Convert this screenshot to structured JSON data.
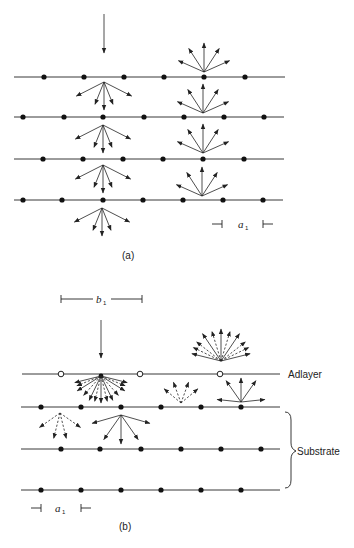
{
  "figure": {
    "panel_a": {
      "caption": "(a)",
      "spacing_label": "a",
      "spacing_subscript": "1",
      "incident_beam": {
        "x": 104,
        "y1": 14,
        "y2": 53
      },
      "rows": [
        {
          "y": 77,
          "x1": 14,
          "x2": 285,
          "atoms": [
            44,
            84,
            124,
            164,
            204,
            245
          ]
        },
        {
          "y": 117,
          "x1": 14,
          "x2": 284,
          "atoms": [
            23,
            64,
            103,
            144,
            184,
            224,
            264
          ]
        },
        {
          "y": 159,
          "x1": 14,
          "x2": 284,
          "atoms": [
            43,
            83,
            123,
            163,
            203,
            244
          ]
        },
        {
          "y": 200,
          "x1": 14,
          "x2": 283,
          "atoms": [
            23,
            62,
            103,
            143,
            183,
            223,
            263
          ]
        }
      ],
      "transmitted_fans": [
        {
          "x": 104,
          "y": 82
        },
        {
          "x": 103,
          "y": 125
        },
        {
          "x": 103,
          "y": 165
        },
        {
          "x": 102,
          "y": 208
        }
      ],
      "reflected_fans": [
        {
          "x": 204,
          "y": 72
        },
        {
          "x": 203,
          "y": 113
        },
        {
          "x": 203,
          "y": 153
        },
        {
          "x": 202,
          "y": 196
        }
      ],
      "spacing_marker": {
        "y": 224,
        "x_left": 222,
        "x_right": 263
      }
    },
    "panel_b": {
      "caption": "(b)",
      "adlayer_label": "Adlayer",
      "substrate_label": "Substrate",
      "adlayer_spacing_label": "b",
      "adlayer_spacing_subscript": "1",
      "substrate_spacing_label": "a",
      "substrate_spacing_subscript": "1",
      "incident_beam": {
        "x": 101,
        "y1": 320,
        "y2": 358
      },
      "adlayer_row": {
        "y": 374,
        "x1": 22,
        "x2": 280,
        "open_atoms": [
          61,
          140,
          220
        ]
      },
      "substrate_rows": [
        {
          "y": 407,
          "x1": 21,
          "x2": 280,
          "atoms": [
            41,
            81,
            121,
            161,
            201,
            241
          ]
        },
        {
          "y": 449,
          "x1": 21,
          "x2": 280,
          "atoms": [
            61,
            100,
            141,
            181,
            221,
            261
          ]
        },
        {
          "y": 490,
          "x1": 21,
          "x2": 280,
          "atoms": [
            41,
            81,
            121,
            161,
            201,
            241
          ]
        }
      ],
      "b1_marker": {
        "y": 299,
        "x_left": 61,
        "x_right": 142
      },
      "a1_marker": {
        "y": 508,
        "x_left": 41,
        "x_right": 81
      }
    }
  }
}
